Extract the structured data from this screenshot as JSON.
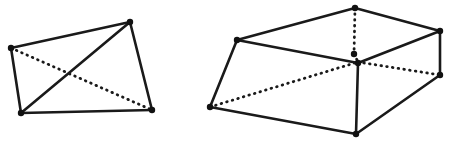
{
  "figure": {
    "background_color": "#ffffff",
    "stroke_color": "#1a1a1a",
    "vertex_color": "#111111",
    "solid_stroke_width": 2.6,
    "dotted_stroke_width": 2.8,
    "dotted_dash_pattern": "0.6 5.2",
    "vertex_radius": 3.2,
    "width": 459,
    "height": 143
  },
  "shapes": [
    {
      "id": "left-quadrilateral",
      "label": "Quadrilateral with two diagonals",
      "vertices": [
        {
          "name": "top-left",
          "x": 11,
          "y": 48
        },
        {
          "name": "top-right",
          "x": 130,
          "y": 22
        },
        {
          "name": "bottom-right",
          "x": 152,
          "y": 110
        },
        {
          "name": "bottom-left",
          "x": 21,
          "y": 113
        }
      ],
      "solid_edges": [
        {
          "name": "edge-top",
          "x1": 11,
          "y1": 48,
          "x2": 130,
          "y2": 22
        },
        {
          "name": "edge-right",
          "x1": 130,
          "y1": 22,
          "x2": 152,
          "y2": 110
        },
        {
          "name": "edge-bottom",
          "x1": 152,
          "y1": 110,
          "x2": 21,
          "y2": 113
        },
        {
          "name": "edge-left",
          "x1": 21,
          "y1": 113,
          "x2": 11,
          "y2": 48
        },
        {
          "name": "diagonal-solid",
          "x1": 21,
          "y1": 113,
          "x2": 130,
          "y2": 22
        }
      ],
      "dotted_edges": [
        {
          "name": "diagonal-hidden",
          "x1": 11,
          "y1": 48,
          "x2": 152,
          "y2": 110
        }
      ]
    },
    {
      "id": "right-frustum",
      "label": "Truncated pyramid wireframe with hidden edges",
      "vertices": [
        {
          "name": "top-apex",
          "x": 355,
          "y": 8
        },
        {
          "name": "upper-left",
          "x": 237,
          "y": 40
        },
        {
          "name": "upper-right",
          "x": 440,
          "y": 31
        },
        {
          "name": "center-hidden-node",
          "x": 354,
          "y": 54
        },
        {
          "name": "center-junction",
          "x": 358,
          "y": 63
        },
        {
          "name": "lower-left",
          "x": 210,
          "y": 107
        },
        {
          "name": "lower-right",
          "x": 440,
          "y": 75
        },
        {
          "name": "bottom-front",
          "x": 356,
          "y": 134
        }
      ],
      "solid_edges": [
        {
          "name": "top-edge-left",
          "x1": 237,
          "y1": 40,
          "x2": 355,
          "y2": 8
        },
        {
          "name": "top-edge-right",
          "x1": 355,
          "y1": 8,
          "x2": 440,
          "y2": 31
        },
        {
          "name": "upper-left-to-center",
          "x1": 237,
          "y1": 40,
          "x2": 358,
          "y2": 63
        },
        {
          "name": "center-to-upper-right",
          "x1": 358,
          "y1": 63,
          "x2": 440,
          "y2": 31
        },
        {
          "name": "left-side-edge",
          "x1": 237,
          "y1": 40,
          "x2": 210,
          "y2": 107
        },
        {
          "name": "right-side-edge",
          "x1": 440,
          "y1": 31,
          "x2": 440,
          "y2": 75
        },
        {
          "name": "center-vertical",
          "x1": 358,
          "y1": 63,
          "x2": 356,
          "y2": 134
        },
        {
          "name": "bottom-edge-left",
          "x1": 210,
          "y1": 107,
          "x2": 356,
          "y2": 134
        },
        {
          "name": "bottom-edge-right",
          "x1": 356,
          "y1": 134,
          "x2": 440,
          "y2": 75
        }
      ],
      "dotted_edges": [
        {
          "name": "apex-vertical-hidden",
          "x1": 355,
          "y1": 8,
          "x2": 354,
          "y2": 54
        },
        {
          "name": "hidden-diagonal-left",
          "x1": 210,
          "y1": 107,
          "x2": 358,
          "y2": 62
        },
        {
          "name": "hidden-diagonal-right",
          "x1": 358,
          "y1": 62,
          "x2": 440,
          "y2": 75
        },
        {
          "name": "hidden-node-to-junction",
          "x1": 354,
          "y1": 54,
          "x2": 358,
          "y2": 62
        }
      ]
    }
  ]
}
